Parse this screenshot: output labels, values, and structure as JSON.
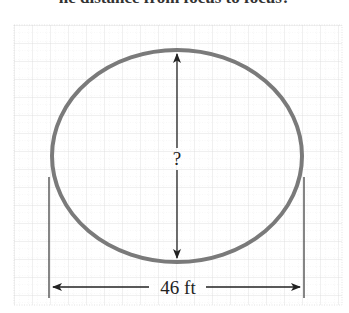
{
  "header": {
    "clipped_text": "he distance from focus to focus?"
  },
  "diagram": {
    "type": "ellipse-dimension",
    "shape": "ellipse",
    "horizontal_dimension_label": "46 ft",
    "vertical_dimension_label": "?",
    "colors": {
      "ellipse_stroke": "#7a7a7a",
      "dimension_line": "#333333",
      "grid_major": "#d8d8d8",
      "grid_minor": "#e6e6e6",
      "text": "#222222"
    }
  }
}
